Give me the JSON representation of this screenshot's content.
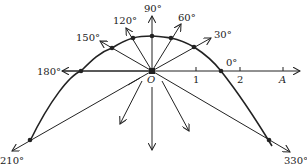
{
  "diagram": {
    "type": "polar-curve",
    "origin_label": "O",
    "axis_labels": {
      "tick_1": "1",
      "tick_2": "2",
      "tick_A": "A"
    },
    "angle_labels": {
      "a0": "0°",
      "a30": "30°",
      "a60": "60°",
      "a90": "90°",
      "a120": "120°",
      "a150": "150°",
      "a180": "180°",
      "a210": "210°",
      "a330": "330°"
    },
    "colors": {
      "stroke": "#222222",
      "background": "#ffffff"
    }
  }
}
